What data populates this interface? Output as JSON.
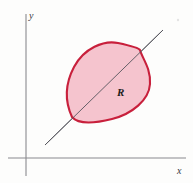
{
  "figure": {
    "background_color": "#fdfdfc",
    "width": 193,
    "height": 183
  },
  "axes": {
    "color": "#8a8a8e",
    "x_axis": {
      "label": "x",
      "label_x": 177,
      "label_y": 174,
      "y_position": 158,
      "x_start": 8,
      "x_end": 186
    },
    "y_axis": {
      "label": "y",
      "label_x": 29,
      "label_y": 19,
      "x_position": 26,
      "y_start": 14,
      "y_end": 176
    },
    "origin": {
      "x": 26,
      "y": 158
    }
  },
  "diagonal": {
    "name": "line-of-symmetry",
    "color": "#55555c",
    "x1": 45,
    "y1": 145,
    "x2": 163,
    "y2": 30
  },
  "region": {
    "label": "R",
    "label_x": 117,
    "label_y": 96,
    "fill_color": "#f5c4ce",
    "stroke_color": "#c8203c",
    "stroke_width": 2.1,
    "cusp_lower_left": {
      "x": 72,
      "y": 117
    },
    "cusp_upper_right": {
      "x": 140,
      "y": 50
    },
    "path": "M 72 117 C 66 104 64 86 74 67 C 84 48 104 40 118 43 C 132 46 139 48 140 50 C 142 58 151 68 150 84 C 149 100 132 114 112 119 C 92 124 78 124 72 117 Z"
  }
}
